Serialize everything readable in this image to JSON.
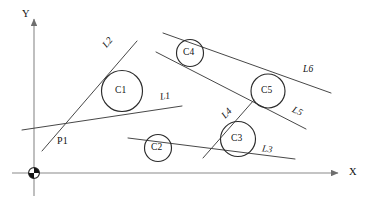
{
  "figure": {
    "background_color": "#ffffff",
    "stroke_color": "#3d3d3d",
    "axis_color": "#808080",
    "caption": ""
  },
  "axes": {
    "x_label": "X",
    "y_label": "Y",
    "origin_marker": "origin-quadrant-circle",
    "x_axis": {
      "x1": 12,
      "y1": 173,
      "x2": 343,
      "y2": 173
    },
    "y_axis": {
      "x1": 34,
      "y1": 196,
      "x2": 34,
      "y2": 14
    },
    "x_label_pos": {
      "x": 349,
      "y": 167
    },
    "y_label_pos": {
      "x": 22,
      "y": 9
    }
  },
  "circles": [
    {
      "id": "C1",
      "cx": 122,
      "cy": 91,
      "r": 20.5,
      "label_x": 115,
      "label_y": 87
    },
    {
      "id": "C2",
      "cx": 158,
      "cy": 148,
      "r": 13.5,
      "label_x": 151,
      "label_y": 144
    },
    {
      "id": "C3",
      "cx": 238,
      "cy": 139,
      "r": 17.5,
      "label_x": 231,
      "label_y": 135
    },
    {
      "id": "C4",
      "cx": 190,
      "cy": 53,
      "r": 13.5,
      "label_x": 183,
      "label_y": 49
    },
    {
      "id": "C5",
      "cx": 268,
      "cy": 91,
      "r": 17.0,
      "label_x": 261,
      "label_y": 87
    }
  ],
  "lines": [
    {
      "id": "L1",
      "x1": 22,
      "y1": 130,
      "x2": 182,
      "y2": 106,
      "label_x": 160,
      "label_y": 92,
      "rot": -9
    },
    {
      "id": "L2",
      "x1": 42,
      "y1": 151,
      "x2": 137,
      "y2": 41,
      "label_x": 103,
      "label_y": 38,
      "rot": -50
    },
    {
      "id": "L3",
      "x1": 128,
      "y1": 138,
      "x2": 295,
      "y2": 159,
      "label_x": 262,
      "label_y": 145,
      "rot": 8
    },
    {
      "id": "L4",
      "x1": 203,
      "y1": 158,
      "x2": 254,
      "y2": 100,
      "label_x": 222,
      "label_y": 109,
      "rot": -47
    },
    {
      "id": "L5",
      "x1": 156,
      "y1": 52,
      "x2": 306,
      "y2": 129,
      "label_x": 292,
      "label_y": 107,
      "rot": 27
    },
    {
      "id": "L6",
      "x1": 163,
      "y1": 33,
      "x2": 331,
      "y2": 93,
      "label_x": 303,
      "label_y": 65,
      "rot": 0
    }
  ],
  "points": [
    {
      "id": "P1",
      "x": 57,
      "y": 136
    }
  ]
}
